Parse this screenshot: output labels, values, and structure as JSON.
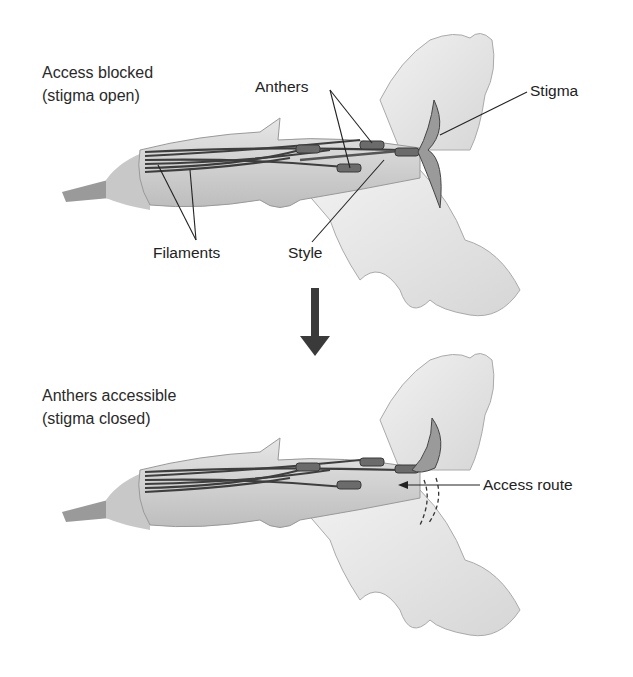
{
  "panels": [
    {
      "state": "Access blocked",
      "condition": "(stigma open)",
      "labels": {
        "anthers": "Anthers",
        "stigma": "Stigma",
        "filaments": "Filaments",
        "style": "Style"
      }
    },
    {
      "state": "Anthers accessible",
      "condition": "(stigma closed)",
      "labels": {
        "access_route": "Access route"
      }
    }
  ],
  "transition_arrow": "down-arrow",
  "colors": {
    "petal_fill": "#ececec",
    "petal_shade": "#cfcfcf",
    "filament": "#4a4a4a",
    "anther": "#6b6b6b",
    "text": "#222222"
  }
}
